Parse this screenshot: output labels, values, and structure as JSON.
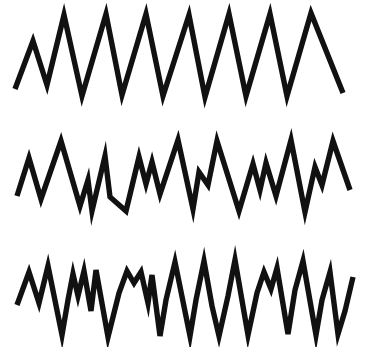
{
  "figure": {
    "background_color": "#ffffff",
    "width": 375,
    "height": 347
  },
  "chart_data": {
    "type": "line",
    "title": "",
    "subtitle": "",
    "xlabel": "",
    "ylabel": "",
    "grid": false,
    "legend_position": "none",
    "axis_visible": false,
    "xlim": [
      0,
      375
    ],
    "ylim": [
      0,
      347
    ],
    "stroke_color": "#111111",
    "stroke_width": 5.4,
    "series": [
      {
        "name": "trace-1-regular-sawtooth",
        "label": "Top trace — regular high-amplitude zigzag",
        "stroke_color": "#111111",
        "stroke_width": 5.4,
        "points": [
          [
            15,
            89
          ],
          [
            33,
            41
          ],
          [
            47,
            85
          ],
          [
            64,
            15
          ],
          [
            82,
            96
          ],
          [
            106,
            14
          ],
          [
            122,
            95
          ],
          [
            146,
            14
          ],
          [
            163,
            96
          ],
          [
            189,
            15
          ],
          [
            205,
            97
          ],
          [
            229,
            14
          ],
          [
            246,
            96
          ],
          [
            270,
            14
          ],
          [
            287,
            96
          ],
          [
            311,
            13
          ],
          [
            343,
            93
          ]
        ]
      },
      {
        "name": "trace-2-mixed-amplitude",
        "label": "Middle trace — irregular mixed-amplitude zigzag",
        "stroke_color": "#111111",
        "stroke_width": 5.4,
        "points": [
          [
            17,
            196
          ],
          [
            29,
            158
          ],
          [
            41,
            199
          ],
          [
            61,
            141
          ],
          [
            80,
            206
          ],
          [
            88,
            180
          ],
          [
            92,
            211
          ],
          [
            105,
            156
          ],
          [
            110,
            197
          ],
          [
            126,
            211
          ],
          [
            139,
            157
          ],
          [
            146,
            184
          ],
          [
            152,
            162
          ],
          [
            160,
            194
          ],
          [
            178,
            140
          ],
          [
            193,
            209
          ],
          [
            199,
            172
          ],
          [
            208,
            185
          ],
          [
            217,
            141
          ],
          [
            239,
            211
          ],
          [
            253,
            164
          ],
          [
            260,
            190
          ],
          [
            266,
            163
          ],
          [
            276,
            196
          ],
          [
            291,
            140
          ],
          [
            305,
            212
          ],
          [
            315,
            167
          ],
          [
            322,
            185
          ],
          [
            333,
            141
          ],
          [
            350,
            190
          ]
        ]
      },
      {
        "name": "trace-3-dense-noisy",
        "label": "Bottom trace — dense, high-frequency noisy zigzag",
        "stroke_color": "#111111",
        "stroke_width": 5.4,
        "points": [
          [
            17,
            305
          ],
          [
            29,
            272
          ],
          [
            39,
            303
          ],
          [
            48,
            266
          ],
          [
            62,
            335
          ],
          [
            68,
            300
          ],
          [
            73,
            274
          ],
          [
            78,
            296
          ],
          [
            84,
            271
          ],
          [
            91,
            311
          ],
          [
            96,
            270
          ],
          [
            103,
            309
          ],
          [
            108,
            337
          ],
          [
            119,
            293
          ],
          [
            127,
            271
          ],
          [
            134,
            283
          ],
          [
            141,
            272
          ],
          [
            148,
            303
          ],
          [
            152,
            275
          ],
          [
            160,
            336
          ],
          [
            166,
            300
          ],
          [
            175,
            262
          ],
          [
            190,
            336
          ],
          [
            196,
            300
          ],
          [
            204,
            261
          ],
          [
            212,
            306
          ],
          [
            219,
            336
          ],
          [
            228,
            296
          ],
          [
            235,
            260
          ],
          [
            248,
            335
          ],
          [
            257,
            293
          ],
          [
            264,
            272
          ],
          [
            271,
            289
          ],
          [
            277,
            268
          ],
          [
            288,
            334
          ],
          [
            295,
            290
          ],
          [
            303,
            261
          ],
          [
            316,
            335
          ],
          [
            322,
            300
          ],
          [
            330,
            272
          ],
          [
            338,
            334
          ],
          [
            345,
            311
          ],
          [
            353,
            277
          ]
        ]
      }
    ]
  }
}
